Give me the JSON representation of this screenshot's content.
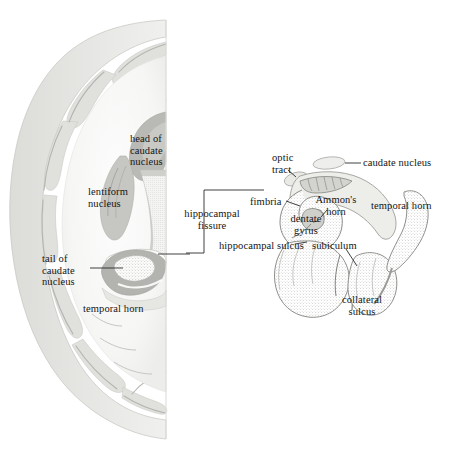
{
  "figure": {
    "background": "#ffffff",
    "ink": "#151515",
    "palette": {
      "white_matter": "#f4f4f3",
      "cortex_gray": "#e3e3e1",
      "cortex_edge": "#c9c9c6",
      "nucleus_gray": "#c2c2bf",
      "nucleus_dark": "#a9a9a5",
      "stipple": "#b5b5b1",
      "outline": "#8d8d89",
      "leader_line": "#2a2a2a"
    }
  },
  "left_panel": {
    "name": "coronal-hemisphere-section",
    "labels": [
      {
        "id": "head-of-caudate-nucleus",
        "text": "head of\ncaudate\nnucleus",
        "x": 130,
        "y": 133,
        "align": "left"
      },
      {
        "id": "lentiform-nucleus",
        "text": "lentiform\nnucleus",
        "x": 88,
        "y": 186,
        "align": "left"
      },
      {
        "id": "tail-of-caudate-nucleus",
        "text": "tail of\ncaudate\nnucleus",
        "x": 42,
        "y": 253,
        "align": "left"
      },
      {
        "id": "temporal-horn-left",
        "text": "temporal horn",
        "x": 83,
        "y": 303,
        "align": "left"
      }
    ],
    "leaders": [
      {
        "id": "leader-tail-of-caudate",
        "points": "90,268 123,268"
      }
    ]
  },
  "callout": {
    "name": "magnification-bracket",
    "label": {
      "id": "hippocampal-fissure",
      "text": "hippocampal\nfissure",
      "x": 176,
      "y": 208
    },
    "bracket_points": "186,253 186,254 204,254 204,190 264,190",
    "tick_points": "155,255 190,255"
  },
  "right_panel": {
    "name": "hippocampal-formation-detail",
    "labels": [
      {
        "id": "optic-tract",
        "text": "optic\ntract",
        "x": 272,
        "y": 152,
        "align": "left"
      },
      {
        "id": "caudate-nucleus",
        "text": "caudate nucleus",
        "x": 363,
        "y": 161,
        "align": "left"
      },
      {
        "id": "fimbria",
        "text": "fimbria",
        "x": 254,
        "y": 198,
        "align": "left"
      },
      {
        "id": "ammons-horn",
        "text": "Ammon's\nhorn",
        "x": 322,
        "y": 197,
        "align": "left"
      },
      {
        "id": "temporal-horn-right",
        "text": "temporal horn",
        "x": 373,
        "y": 202,
        "align": "left"
      },
      {
        "id": "dentate-gyrus",
        "text": "dentate\ngyrus",
        "x": 288,
        "y": 215,
        "align": "left"
      },
      {
        "id": "hippocampal-sulcus",
        "text": "hippocampal sulcus",
        "x": 220,
        "y": 241,
        "align": "left"
      },
      {
        "id": "subiculum",
        "text": "subiculum",
        "x": 313,
        "y": 241,
        "align": "left"
      },
      {
        "id": "collateral-sulcus",
        "text": "collateral\nsulcus",
        "x": 338,
        "y": 295,
        "align": "left"
      }
    ],
    "leaders": [
      {
        "id": "leader-caudate-nucleus",
        "points": "343,163 360,163"
      },
      {
        "id": "leader-optic-tract",
        "points": "287,168 294,176"
      },
      {
        "id": "leader-fimbria",
        "points": "286,202 299,207"
      },
      {
        "id": "leader-ammons-horn",
        "points": "327,209 322,216"
      },
      {
        "id": "leader-dentate-gyrus",
        "points": "312,222 318,221"
      },
      {
        "id": "leader-hippocampal-sulcus",
        "points": "294,244 306,243"
      },
      {
        "id": "leader-subiculum",
        "points": "345,248 356,265"
      }
    ]
  }
}
